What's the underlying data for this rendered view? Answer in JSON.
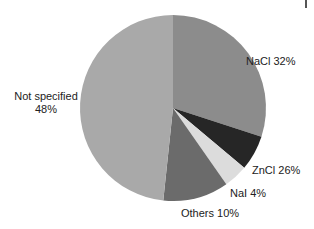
{
  "chart_data": {
    "type": "pie",
    "title": "",
    "slices": [
      {
        "label": "NaCl",
        "value": 32,
        "display": "NaCl 32%",
        "color": "#8c8c8c"
      },
      {
        "label": "ZnCl",
        "value": 26,
        "display": "ZnCl 26%",
        "color": "#262626"
      },
      {
        "label": "NaI",
        "value": 4,
        "display": "NaI 4%",
        "color": "#dcdcdc"
      },
      {
        "label": "Others",
        "value": 10,
        "display": "Others 10%",
        "color": "#6b6b6b"
      },
      {
        "label": "Not specified",
        "value": 48,
        "display": "Not specified 48%",
        "color": "#a9a9a9"
      }
    ],
    "legend": "none (direct labels)"
  },
  "labels": {
    "nacl": "NaCl 32%",
    "zncl": "ZnCl 26%",
    "nai": "NaI 4%",
    "others": "Others 10%",
    "not_specified_line1": "Not specified",
    "not_specified_line2": "48%"
  },
  "render": {
    "cx": 173,
    "cy": 108,
    "r": 93,
    "angles_deg": [
      [
        0,
        108
      ],
      [
        108,
        130
      ],
      [
        130,
        145
      ],
      [
        145,
        186
      ],
      [
        186,
        360
      ]
    ]
  }
}
